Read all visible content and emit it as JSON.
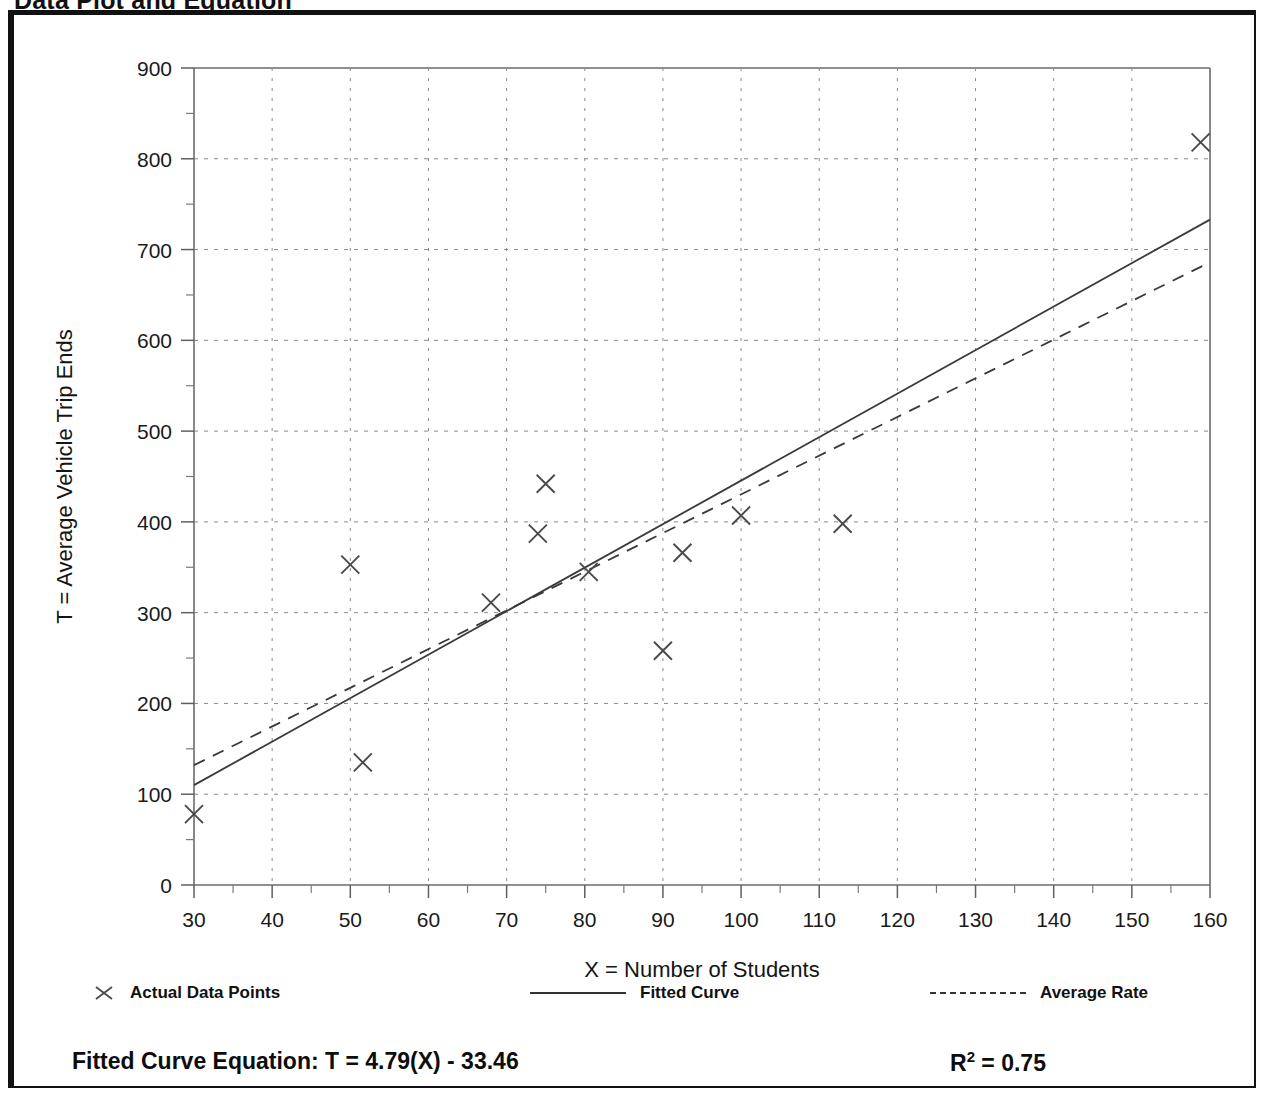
{
  "page": {
    "title": "Data Plot and Equation"
  },
  "chart_data": {
    "type": "scatter",
    "title": "Data Plot and Equation",
    "xlabel": "X = Number of Students",
    "ylabel": "T = Average Vehicle Trip Ends",
    "xlim": [
      30,
      160
    ],
    "ylim": [
      0,
      900
    ],
    "xticks": [
      30,
      40,
      50,
      60,
      70,
      80,
      90,
      100,
      110,
      120,
      130,
      140,
      150,
      160
    ],
    "yticks": [
      0,
      100,
      200,
      300,
      400,
      500,
      600,
      700,
      800,
      900
    ],
    "xtick_minor_step": 5,
    "ytick_minor_step": 50,
    "grid": true,
    "legend_position": "below-axis",
    "series": [
      {
        "name": "Actual Data Points",
        "type": "scatter",
        "marker": "x",
        "points": [
          [
            30.0,
            78
          ],
          [
            50.0,
            353
          ],
          [
            51.6,
            135
          ],
          [
            68.0,
            311
          ],
          [
            74.0,
            387
          ],
          [
            75.0,
            442
          ],
          [
            80.5,
            345
          ],
          [
            90.0,
            258
          ],
          [
            92.5,
            366
          ],
          [
            100.0,
            407
          ],
          [
            113.0,
            398
          ],
          [
            158.8,
            818
          ]
        ]
      },
      {
        "name": "Fitted Curve",
        "type": "line",
        "style": "solid",
        "endpoints": [
          [
            30,
            110
          ],
          [
            160,
            733
          ]
        ],
        "equation": "T = 4.79(X) - 33.46",
        "slope": 4.79,
        "intercept": -33.46
      },
      {
        "name": "Average Rate",
        "type": "line",
        "style": "dashed",
        "endpoints": [
          [
            30,
            132
          ],
          [
            160,
            686
          ]
        ],
        "slope": 4.262,
        "intercept": 4.0
      }
    ],
    "annotations": {
      "equation_label": "Fitted Curve Equation:",
      "equation": "T = 4.79(X) - 33.46",
      "r_squared_label": "R",
      "r_squared_exponent": "2",
      "r_squared_value": "= 0.75",
      "r_squared": 0.75
    }
  },
  "legend": {
    "items": [
      {
        "label": "Actual Data Points",
        "swatch": "x-marker"
      },
      {
        "label": "Fitted Curve",
        "swatch": "solid-line"
      },
      {
        "label": "Average Rate",
        "swatch": "dashed-line"
      }
    ]
  },
  "footer": {
    "equation_full": "Fitted Curve Equation:  T = 4.79(X) - 33.46",
    "r2_prefix": "R",
    "r2_sup": "2",
    "r2_suffix": " = 0.75"
  },
  "colors": {
    "ink": "#111111",
    "grid": "#8a8a8a",
    "line": "#3a3a3a",
    "marker": "#4a4a4a",
    "background": "#ffffff"
  }
}
